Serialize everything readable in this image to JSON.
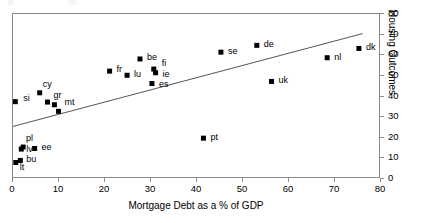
{
  "chart_data": {
    "type": "scatter",
    "title": "",
    "xlabel": "Mortgage Debt as a % of GDP",
    "ylabel": "Housing Outcomes",
    "xlim": [
      0,
      80
    ],
    "ylim": [
      0,
      80
    ],
    "xticks": [
      0,
      10,
      20,
      30,
      40,
      50,
      60,
      70,
      80
    ],
    "yticks": [
      0,
      10,
      20,
      30,
      40,
      50,
      60,
      70,
      80
    ],
    "xtick_labels": [
      "0",
      "10",
      "20",
      "30",
      "40",
      "50",
      "60",
      "70",
      "80"
    ],
    "ytick_labels": [
      "0",
      "10",
      "20",
      "30",
      "40",
      "50",
      "60",
      "70",
      "80"
    ],
    "grid": false,
    "legend": false,
    "y_axis_position": "right",
    "marker": "square",
    "marker_color": "#000000",
    "points": [
      {
        "label": "si",
        "x": 0.5,
        "y": 37.5,
        "label_dx": 8,
        "label_dy": -4
      },
      {
        "label": "lt",
        "x": 0.6,
        "y": 8.0,
        "label_dx": 4,
        "label_dy": 4
      },
      {
        "label": "bu",
        "x": 1.6,
        "y": 9.0,
        "label_dx": 6,
        "label_dy": -1
      },
      {
        "label": "lv",
        "x": 1.8,
        "y": 14.5,
        "label_dx": 5,
        "label_dy": 0
      },
      {
        "label": "pl",
        "x": 2.2,
        "y": 15.5,
        "label_dx": 3,
        "label_dy": -9
      },
      {
        "label": "ee",
        "x": 4.7,
        "y": 14.8,
        "label_dx": 7,
        "label_dy": -1
      },
      {
        "label": "cy",
        "x": 5.8,
        "y": 41.8,
        "label_dx": 3,
        "label_dy": -9
      },
      {
        "label": "gr",
        "x": 7.5,
        "y": 37.3,
        "label_dx": 6,
        "label_dy": -7
      },
      {
        "label": "mt",
        "x": 9.0,
        "y": 36.0,
        "label_dx": 10,
        "label_dy": -3
      },
      {
        "label": "",
        "x": 9.9,
        "y": 32.8,
        "label_dx": 0,
        "label_dy": 0
      },
      {
        "label": "fr",
        "x": 21.0,
        "y": 52.3,
        "label_dx": 7,
        "label_dy": -2
      },
      {
        "label": "lu",
        "x": 24.8,
        "y": 50.3,
        "label_dx": 7,
        "label_dy": -1
      },
      {
        "label": "be",
        "x": 27.6,
        "y": 58.2,
        "label_dx": 7,
        "label_dy": -2
      },
      {
        "label": "fi",
        "x": 30.6,
        "y": 53.3,
        "label_dx": 8,
        "label_dy": -6
      },
      {
        "label": "ie",
        "x": 31.0,
        "y": 51.5,
        "label_dx": 7,
        "label_dy": 1
      },
      {
        "label": "es",
        "x": 30.2,
        "y": 46.3,
        "label_dx": 7,
        "label_dy": 0
      },
      {
        "label": "pt",
        "x": 41.4,
        "y": 19.8,
        "label_dx": 7,
        "label_dy": -1
      },
      {
        "label": "se",
        "x": 45.2,
        "y": 61.5,
        "label_dx": 7,
        "label_dy": -1
      },
      {
        "label": "de",
        "x": 53.0,
        "y": 64.8,
        "label_dx": 7,
        "label_dy": -1
      },
      {
        "label": "uk",
        "x": 56.2,
        "y": 47.3,
        "label_dx": 7,
        "label_dy": -1
      },
      {
        "label": "nl",
        "x": 68.3,
        "y": 58.8,
        "label_dx": 7,
        "label_dy": -1
      },
      {
        "label": "dk",
        "x": 75.2,
        "y": 63.3,
        "label_dx": 7,
        "label_dy": -1
      }
    ],
    "trendline": {
      "type": "linear",
      "x_start": 0,
      "y_start": 25.5,
      "x_end": 76.0,
      "y_end": 70.5,
      "color": "#555555"
    }
  }
}
